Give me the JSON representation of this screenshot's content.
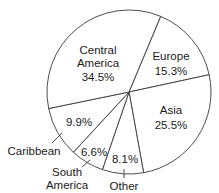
{
  "chart_data": {
    "type": "pie",
    "title": "",
    "start_angle_deg": 22.7,
    "direction": "clockwise",
    "categories": [
      "Europe",
      "Asia",
      "Other",
      "South America",
      "Caribbean",
      "Central America"
    ],
    "values": [
      15.3,
      25.5,
      8.1,
      6.6,
      9.9,
      34.5
    ],
    "unit": "%",
    "labels": [
      {
        "name": "Europe",
        "value_text": "15.3%",
        "inside": true
      },
      {
        "name": "Asia",
        "value_text": "25.5%",
        "inside": true
      },
      {
        "name": "Other",
        "value_text": "8.1%",
        "inside": false
      },
      {
        "name": "South America",
        "value_text": "6.6%",
        "inside": false
      },
      {
        "name": "Caribbean",
        "value_text": "9.9%",
        "inside": false
      },
      {
        "name": "Central America",
        "value_text": "34.5%",
        "inside": true
      }
    ],
    "colors": {
      "fill": "#ffffff",
      "stroke": "#3a3a3a",
      "text": "#1a1a1a"
    }
  },
  "labels": {
    "central_line1": "Central",
    "central_line2": "America",
    "central_value": "34.5%",
    "europe_name": "Europe",
    "europe_value": "15.3%",
    "asia_name": "Asia",
    "asia_value": "25.5%",
    "caribbean_value": "9.9%",
    "caribbean_name": "Caribbean",
    "southam_value": "6.6%",
    "southam_line1": "South",
    "southam_line2": "America",
    "other_value": "8.1%",
    "other_name": "Other"
  }
}
